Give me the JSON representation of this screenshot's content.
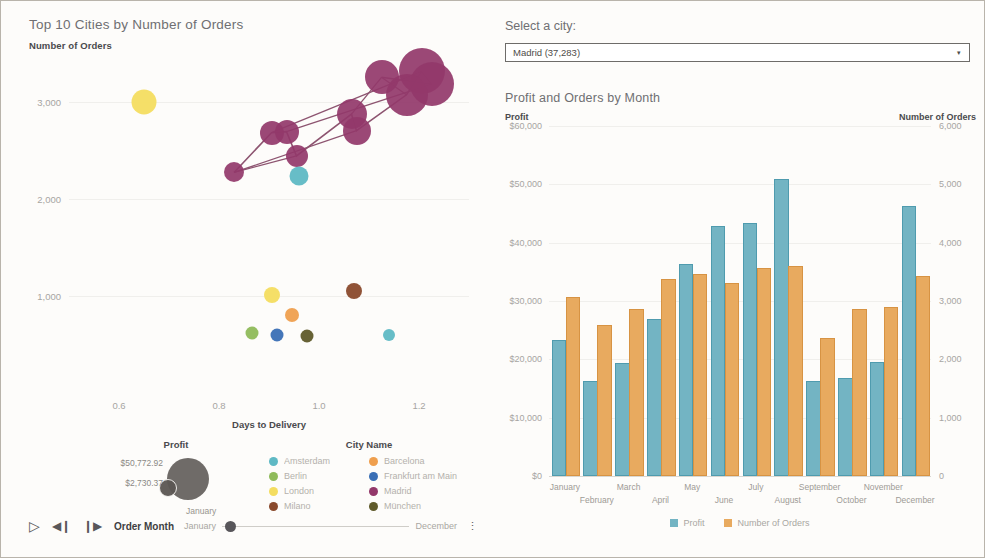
{
  "scatter": {
    "title": "Top 10 Cities by Number of Orders",
    "y_axis_title": "Number of Orders",
    "x_axis_title": "Days to Delivery",
    "yticks": [
      "1,000",
      "2,000",
      "3,000"
    ],
    "xticks": [
      "0.6",
      "0.8",
      "1.0",
      "1.2"
    ]
  },
  "profit_legend": {
    "title": "Profit",
    "max_label": "$50,772.92",
    "min_label": "$2,730.37",
    "annotation": "January"
  },
  "city_legend": {
    "title": "City Name",
    "items": [
      {
        "label": "Amsterdam",
        "color": "#5fb9c4"
      },
      {
        "label": "Barcelona",
        "color": "#ef9f4e"
      },
      {
        "label": "Berlin",
        "color": "#8fbb5a"
      },
      {
        "label": "Frankfurt am Main",
        "color": "#3a6fb5"
      },
      {
        "label": "London",
        "color": "#f4dd60"
      },
      {
        "label": "Madrid",
        "color": "#93386a"
      },
      {
        "label": "Milano",
        "color": "#8a4a2c"
      },
      {
        "label": "München",
        "color": "#5f5a2a"
      }
    ]
  },
  "playback": {
    "play_icon": "▷",
    "step_back_icon": "◀❙",
    "step_forward_icon": "❙▶",
    "field_label": "Order Month",
    "start_label": "January",
    "end_label": "December",
    "menu_icon": "⋮"
  },
  "city_picker": {
    "label": "Select a city:",
    "selected": "Madrid (37,283)",
    "arrow_icon": "▾"
  },
  "bar_panel": {
    "title": "Profit and Orders by Month",
    "left_axis_title": "Profit",
    "right_axis_title": "Number of Orders",
    "legend": [
      {
        "label": "Profit",
        "color": "#73b4c3"
      },
      {
        "label": "Number of Orders",
        "color": "#e8aa5f"
      }
    ]
  },
  "chart_data": [
    {
      "type": "scatter",
      "title": "Top 10 Cities by Number of Orders",
      "xlabel": "Days to Delivery",
      "ylabel": "Number of Orders",
      "xlim": [
        0.5,
        1.3
      ],
      "ylim": [
        0,
        3500
      ],
      "grid": true,
      "legend_position": "bottom",
      "size_encoding": {
        "field": "Profit",
        "min": 2730.37,
        "max": 50772.92
      },
      "points": [
        {
          "city": "Madrid",
          "color": "#93386a",
          "x": 1.205,
          "y": 3310,
          "profit": 50772.92,
          "size": 46
        },
        {
          "city": "Madrid",
          "color": "#93386a",
          "x": 1.225,
          "y": 3180,
          "profit": 47000,
          "size": 44
        },
        {
          "city": "Madrid",
          "color": "#93386a",
          "x": 1.175,
          "y": 3070,
          "profit": 44000,
          "size": 42
        },
        {
          "city": "Madrid",
          "color": "#93386a",
          "x": 1.125,
          "y": 3250,
          "profit": 33000,
          "size": 34
        },
        {
          "city": "Madrid",
          "color": "#93386a",
          "x": 1.065,
          "y": 2870,
          "profit": 27000,
          "size": 30
        },
        {
          "city": "Madrid",
          "color": "#93386a",
          "x": 1.075,
          "y": 2700,
          "profit": 24000,
          "size": 28
        },
        {
          "city": "Madrid",
          "color": "#93386a",
          "x": 0.905,
          "y": 2680,
          "profit": 18000,
          "size": 24
        },
        {
          "city": "Madrid",
          "color": "#93386a",
          "x": 0.935,
          "y": 2690,
          "profit": 18000,
          "size": 24
        },
        {
          "city": "Madrid",
          "color": "#93386a",
          "x": 0.955,
          "y": 2440,
          "profit": 16000,
          "size": 22
        },
        {
          "city": "Madrid",
          "color": "#93386a",
          "x": 0.83,
          "y": 2270,
          "profit": 13000,
          "size": 20
        },
        {
          "city": "Amsterdam",
          "color": "#5fb9c4",
          "x": 0.96,
          "y": 2235,
          "profit": 9000,
          "size": 19
        },
        {
          "city": "London",
          "color": "#f4dd60",
          "x": 0.65,
          "y": 2995,
          "profit": 15000,
          "size": 25
        },
        {
          "city": "London",
          "color": "#f4dd60",
          "x": 0.905,
          "y": 1005,
          "profit": 7000,
          "size": 16
        },
        {
          "city": "Milano",
          "color": "#8a4a2c",
          "x": 1.07,
          "y": 1045,
          "profit": 7000,
          "size": 16
        },
        {
          "city": "Barcelona",
          "color": "#ef9f4e",
          "x": 0.945,
          "y": 805,
          "profit": 5500,
          "size": 14
        },
        {
          "city": "Berlin",
          "color": "#8fbb5a",
          "x": 0.865,
          "y": 620,
          "profit": 4200,
          "size": 13
        },
        {
          "city": "Frankfurt am Main",
          "color": "#3a6fb5",
          "x": 0.915,
          "y": 600,
          "profit": 4000,
          "size": 13
        },
        {
          "city": "München",
          "color": "#5f5a2a",
          "x": 0.975,
          "y": 590,
          "profit": 4000,
          "size": 13
        },
        {
          "city": "Amsterdam",
          "color": "#5fb9c4",
          "x": 1.14,
          "y": 595,
          "profit": 2730.37,
          "size": 12
        }
      ],
      "trail_order": [
        9,
        6,
        7,
        8,
        4,
        5,
        2,
        0,
        1,
        3
      ]
    },
    {
      "type": "bar",
      "title": "Profit and Orders by Month",
      "xlabel": "",
      "categories": [
        "January",
        "February",
        "March",
        "April",
        "May",
        "June",
        "July",
        "August",
        "September",
        "October",
        "November",
        "December"
      ],
      "series": [
        {
          "name": "Profit",
          "color": "#73b4c3",
          "axis": "left",
          "unit": "$",
          "values": [
            23000,
            16000,
            19000,
            26500,
            36000,
            42500,
            43000,
            50500,
            16000,
            16500,
            19200,
            46000
          ]
        },
        {
          "name": "Number of Orders",
          "color": "#e8aa5f",
          "axis": "right",
          "unit": "",
          "values": [
            3030,
            2550,
            2830,
            3350,
            3430,
            3280,
            3540,
            3560,
            2340,
            2830,
            2870,
            3400
          ]
        }
      ],
      "left_axis": {
        "label": "Profit",
        "ticks": [
          "$0",
          "$10,000",
          "$20,000",
          "$30,000",
          "$40,000",
          "$50,000",
          "$60,000"
        ],
        "lim": [
          0,
          60000
        ]
      },
      "right_axis": {
        "label": "Number of Orders",
        "ticks": [
          "0",
          "1,000",
          "2,000",
          "3,000",
          "4,000",
          "5,000",
          "6,000"
        ],
        "lim": [
          0,
          6000
        ]
      },
      "grid": true,
      "legend_position": "bottom"
    }
  ]
}
